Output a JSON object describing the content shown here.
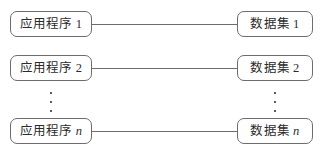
{
  "diagram": {
    "background_color": "#ffffff",
    "border_color": "#6d6d70",
    "text_color": "#2b2b2b",
    "rows": [
      {
        "left": {
          "label": "应用程序",
          "index": "1",
          "index_italic": false
        },
        "right": {
          "label": "数据集",
          "index": "1",
          "index_italic": false
        },
        "connector": "solid-line"
      },
      {
        "left": {
          "label": "应用程序",
          "index": "2",
          "index_italic": false
        },
        "right": {
          "label": "数据集",
          "index": "2",
          "index_italic": false
        },
        "connector": "solid-line"
      },
      {
        "left": {
          "label": "应用程序",
          "index": "n",
          "index_italic": true
        },
        "right": {
          "label": "数据集",
          "index": "n",
          "index_italic": true
        },
        "connector": "solid-line"
      }
    ],
    "ellipsis": {
      "left": "⋮",
      "right": "⋮",
      "dot_count": 3
    }
  }
}
